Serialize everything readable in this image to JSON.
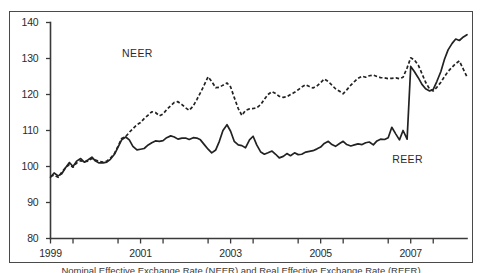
{
  "chart_data": {
    "type": "line",
    "title": "",
    "xlabel": "",
    "ylabel": "",
    "ylim": [
      80,
      140
    ],
    "xlim": [
      1999.0,
      2008.25
    ],
    "grid": false,
    "legend_position": "inline-annotation",
    "y_ticks": [
      80,
      90,
      100,
      110,
      120,
      130,
      140
    ],
    "x_ticks_labeled": [
      1999,
      2001,
      2003,
      2005,
      2007
    ],
    "x_ticks_minor": [
      1999.5,
      2000.5,
      2001.5,
      2002.5,
      2003.5,
      2004.5,
      2005.5,
      2006.5,
      2007.5
    ],
    "annotations": [
      {
        "text": "NEER",
        "x": 2000.9,
        "y": 131.5
      },
      {
        "text": "REER",
        "x": 2006.9,
        "y": 102.0
      }
    ],
    "series": [
      {
        "name": "NEER",
        "style": "dashed",
        "x": [
          1999.0,
          1999.08,
          1999.17,
          1999.25,
          1999.33,
          1999.42,
          1999.5,
          1999.58,
          1999.67,
          1999.75,
          1999.83,
          1999.92,
          2000.0,
          2000.08,
          2000.17,
          2000.25,
          2000.33,
          2000.42,
          2000.5,
          2000.58,
          2000.67,
          2000.75,
          2000.83,
          2000.92,
          2001.0,
          2001.08,
          2001.17,
          2001.25,
          2001.33,
          2001.42,
          2001.5,
          2001.58,
          2001.67,
          2001.75,
          2001.83,
          2001.92,
          2002.0,
          2002.08,
          2002.17,
          2002.25,
          2002.33,
          2002.42,
          2002.5,
          2002.58,
          2002.67,
          2002.75,
          2002.83,
          2002.92,
          2003.0,
          2003.08,
          2003.17,
          2003.25,
          2003.33,
          2003.42,
          2003.5,
          2003.58,
          2003.67,
          2003.75,
          2003.83,
          2003.92,
          2004.0,
          2004.08,
          2004.17,
          2004.25,
          2004.33,
          2004.42,
          2004.5,
          2004.58,
          2004.67,
          2004.75,
          2004.83,
          2004.92,
          2005.0,
          2005.08,
          2005.17,
          2005.25,
          2005.33,
          2005.42,
          2005.5,
          2005.58,
          2005.67,
          2005.75,
          2005.83,
          2005.92,
          2006.0,
          2006.08,
          2006.17,
          2006.25,
          2006.33,
          2006.42,
          2006.5,
          2006.58,
          2006.67,
          2006.75,
          2006.83,
          2006.92,
          2007.0,
          2007.08,
          2007.17,
          2007.25,
          2007.33,
          2007.42,
          2007.5,
          2007.58,
          2007.67,
          2007.75,
          2007.83,
          2007.92,
          2008.0,
          2008.08,
          2008.17,
          2008.25
        ],
        "values": [
          97.2,
          97.6,
          97.0,
          98.4,
          99.6,
          100.6,
          99.8,
          101.0,
          101.6,
          101.3,
          101.5,
          102.2,
          101.8,
          101.4,
          101.2,
          101.5,
          102.3,
          103.6,
          105.6,
          107.8,
          108.3,
          109.5,
          110.5,
          111.6,
          112.2,
          113.3,
          114.3,
          115.2,
          115.0,
          114.1,
          114.6,
          115.8,
          116.9,
          117.8,
          118.0,
          117.2,
          116.3,
          115.6,
          116.8,
          118.6,
          120.5,
          122.8,
          124.9,
          123.6,
          121.9,
          122.0,
          122.6,
          123.2,
          122.1,
          119.2,
          116.1,
          114.2,
          115.6,
          116.0,
          116.1,
          116.3,
          117.2,
          118.7,
          120.0,
          120.8,
          120.3,
          119.5,
          119.2,
          119.4,
          120.0,
          120.6,
          121.3,
          122.1,
          122.7,
          122.2,
          121.8,
          122.4,
          123.3,
          124.3,
          123.6,
          122.6,
          121.6,
          120.9,
          120.2,
          121.3,
          122.6,
          123.6,
          124.5,
          125.1,
          124.8,
          125.2,
          125.4,
          125.0,
          124.7,
          124.6,
          124.4,
          124.5,
          124.6,
          124.4,
          124.8,
          127.4,
          130.2,
          129.6,
          128.1,
          125.8,
          123.4,
          121.5,
          121.0,
          122.0,
          123.4,
          125.0,
          126.4,
          127.6,
          128.6,
          129.3,
          127.0,
          124.9
        ]
      },
      {
        "name": "REER",
        "style": "solid",
        "x": [
          1999.0,
          1999.08,
          1999.17,
          1999.25,
          1999.33,
          1999.42,
          1999.5,
          1999.58,
          1999.67,
          1999.75,
          1999.83,
          1999.92,
          2000.0,
          2000.08,
          2000.17,
          2000.25,
          2000.33,
          2000.42,
          2000.5,
          2000.58,
          2000.67,
          2000.75,
          2000.83,
          2000.92,
          2001.0,
          2001.08,
          2001.17,
          2001.25,
          2001.33,
          2001.42,
          2001.5,
          2001.58,
          2001.67,
          2001.75,
          2001.83,
          2001.92,
          2002.0,
          2002.08,
          2002.17,
          2002.25,
          2002.33,
          2002.42,
          2002.5,
          2002.58,
          2002.67,
          2002.75,
          2002.83,
          2002.92,
          2003.0,
          2003.08,
          2003.17,
          2003.25,
          2003.33,
          2003.42,
          2003.5,
          2003.58,
          2003.67,
          2003.75,
          2003.83,
          2003.92,
          2004.0,
          2004.08,
          2004.17,
          2004.25,
          2004.33,
          2004.42,
          2004.5,
          2004.58,
          2004.67,
          2004.75,
          2004.83,
          2004.92,
          2005.0,
          2005.08,
          2005.17,
          2005.25,
          2005.33,
          2005.42,
          2005.5,
          2005.58,
          2005.67,
          2005.75,
          2005.83,
          2005.92,
          2006.0,
          2006.08,
          2006.17,
          2006.25,
          2006.33,
          2006.42,
          2006.5,
          2006.58,
          2006.67,
          2006.75,
          2006.83,
          2006.92,
          2007.0,
          2007.08,
          2007.17,
          2007.25,
          2007.33,
          2007.42,
          2007.5,
          2007.58,
          2007.67,
          2007.75,
          2007.83,
          2007.92,
          2008.0,
          2008.08,
          2008.17,
          2008.25
        ],
        "values": [
          97.0,
          98.2,
          97.4,
          98.0,
          99.6,
          101.1,
          100.0,
          101.5,
          102.2,
          101.2,
          101.8,
          102.6,
          101.5,
          101.0,
          101.0,
          101.2,
          102.0,
          103.4,
          105.4,
          107.4,
          108.2,
          107.4,
          105.6,
          104.6,
          104.8,
          105.0,
          106.0,
          106.6,
          107.1,
          107.0,
          107.2,
          108.0,
          108.5,
          108.2,
          107.6,
          107.9,
          107.9,
          107.5,
          108.0,
          107.9,
          107.4,
          106.0,
          104.8,
          103.8,
          104.6,
          107.0,
          110.0,
          111.6,
          109.8,
          107.0,
          106.0,
          105.8,
          105.2,
          107.4,
          108.4,
          106.0,
          104.0,
          103.4,
          103.8,
          104.3,
          103.4,
          102.4,
          102.8,
          103.6,
          103.0,
          103.8,
          103.3,
          103.4,
          104.0,
          104.2,
          104.4,
          104.9,
          105.4,
          106.4,
          107.0,
          106.1,
          105.6,
          106.4,
          107.0,
          106.1,
          105.7,
          106.0,
          106.3,
          106.1,
          106.6,
          106.8,
          106.0,
          107.1,
          107.6,
          107.5,
          108.0,
          110.9,
          109.0,
          107.4,
          110.0,
          107.6,
          127.8,
          126.4,
          124.6,
          122.8,
          121.6,
          121.0,
          121.4,
          123.6,
          126.4,
          129.8,
          132.4,
          134.2,
          135.4,
          135.0,
          136.0,
          136.6
        ]
      }
    ]
  },
  "axes": {
    "y_labels": [
      "140",
      "130",
      "120",
      "110",
      "100",
      "90",
      "80"
    ],
    "x_labels": [
      "1999",
      "2001",
      "2003",
      "2005",
      "2007"
    ]
  },
  "labels": {
    "neer": "NEER",
    "reer": "REER"
  },
  "caption": {
    "text": "Nominal Effective Exchange Rate (NEER) and Real Effective Exchange Rate (REER)"
  },
  "colors": {
    "line": "#222222",
    "axis": "#3a3a3a",
    "frame": "#4a4a4a",
    "background": "#ffffff"
  }
}
